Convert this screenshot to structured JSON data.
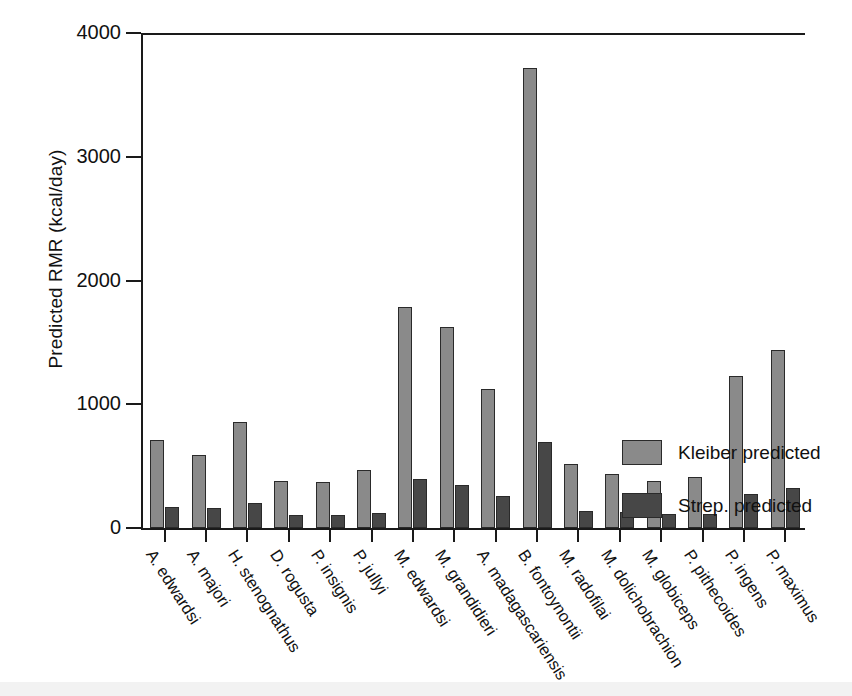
{
  "chart_data": {
    "type": "bar",
    "title": "",
    "xlabel": "",
    "ylabel": "Predicted RMR (kcal/day)",
    "ylim": [
      0,
      4000
    ],
    "yticks": [
      0,
      1000,
      2000,
      3000,
      4000
    ],
    "ytick_labels": [
      "0",
      "1000",
      "2000",
      "3000",
      "4000"
    ],
    "grid": false,
    "legend_position": "right",
    "categories": [
      "A. edwardsi",
      "A. majori",
      "H. stenognathus",
      "D. rogusta",
      "P. insignis",
      "P. jullyi",
      "M. edwardsi",
      "M. grandidieri",
      "A. madagascariensis",
      "B. fontoynontii",
      "M. radofilai",
      "M. dolichobrachion",
      "M. globiceps",
      "P. pithecoides",
      "P. ingens",
      "P. maximus"
    ],
    "series": [
      {
        "name": "Kleiber predicted",
        "color": "#8a8a8a",
        "values": [
          710,
          590,
          855,
          380,
          375,
          470,
          1790,
          1625,
          1125,
          3715,
          695,
          520,
          440,
          380,
          415,
          1230
        ]
      },
      {
        "name": "Strep. predicted",
        "color": "#474747",
        "values": [
          170,
          160,
          205,
          105,
          105,
          120,
          395,
          345,
          255,
          0,
          0,
          140,
          130,
          115,
          115,
          275
        ]
      }
    ],
    "pairs": [
      {
        "category": "A. edwardsi",
        "kleiber": 710,
        "strep": 170
      },
      {
        "category": "A. majori",
        "kleiber": 590,
        "strep": 160
      },
      {
        "category": "H. stenognathus",
        "kleiber": 855,
        "strep": 205
      },
      {
        "category": "D. rogusta",
        "kleiber": 380,
        "strep": 105
      },
      {
        "category": "P. insignis",
        "kleiber": 375,
        "strep": 105
      },
      {
        "category": "P. jullyi",
        "kleiber": 470,
        "strep": 120
      },
      {
        "category": "M. edwardsi",
        "kleiber": 1790,
        "strep": 395
      },
      {
        "category": "M. grandidieri",
        "kleiber": 1625,
        "strep": 345
      },
      {
        "category": "A. madagascariensis",
        "kleiber": 1125,
        "strep": 255
      },
      {
        "category": "B. fontoynontii",
        "kleiber": 3715,
        "strep": 695
      },
      {
        "category": "M. radofilai",
        "kleiber": 520,
        "strep": 140
      },
      {
        "category": "M. dolichobrachion",
        "kleiber": 440,
        "strep": 130
      },
      {
        "category": "M. globiceps",
        "kleiber": 380,
        "strep": 115
      },
      {
        "category": "P. pithecoides",
        "kleiber": 415,
        "strep": 115
      },
      {
        "category": "P. ingens",
        "kleiber": 1230,
        "strep": 275
      },
      {
        "category": "P. maximus",
        "kleiber": 1435,
        "strep": 320
      }
    ]
  },
  "legend": {
    "items": [
      {
        "label": "Kleiber predicted",
        "color": "#8a8a8a"
      },
      {
        "label": "Strep. predicted",
        "color": "#474747"
      }
    ]
  }
}
